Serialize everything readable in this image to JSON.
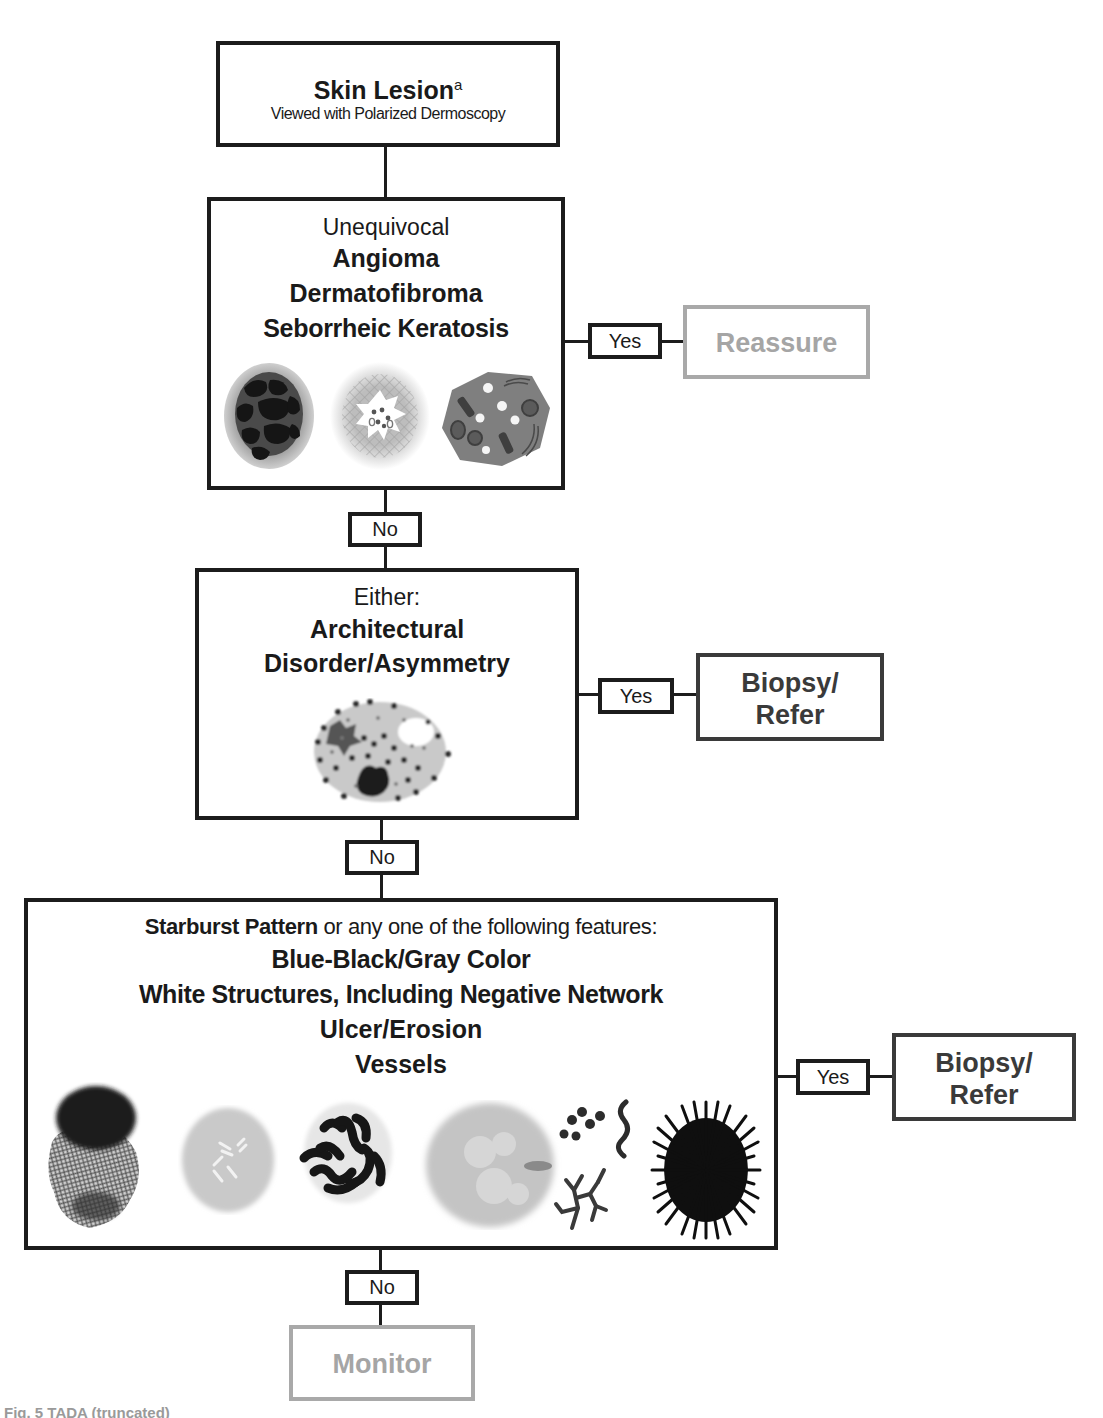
{
  "flowchart": {
    "start": {
      "title": "Skin Lesion",
      "title_superscript": "a",
      "subtitle": "Viewed with Polarized Dermoscopy"
    },
    "step1": {
      "lead": "Unequivocal",
      "items": [
        "Angioma",
        "Dermatofibroma",
        "Seborrheic Keratosis"
      ],
      "images": [
        "angioma-illustration",
        "dermatofibroma-illustration",
        "seborrheic-keratosis-illustration"
      ],
      "yes_label": "Yes",
      "yes_outcome": "Reassure",
      "no_label": "No"
    },
    "step2": {
      "lead": "Either:",
      "items": [
        "Architectural",
        "Disorder/Asymmetry"
      ],
      "images": [
        "disordered-lesion-illustration"
      ],
      "yes_label": "Yes",
      "yes_outcome_line1": "Biopsy/",
      "yes_outcome_line2": "Refer",
      "no_label": "No"
    },
    "step3": {
      "lead_bold": "Starburst Pattern",
      "lead_rest": " or any one of the following features:",
      "items": [
        "Blue-Black/Gray Color",
        "White Structures, Including Negative Network",
        "Ulcer/Erosion",
        "Vessels"
      ],
      "images": [
        "blue-black-gray-illustration",
        "white-structures-illustration",
        "negative-network-illustration",
        "ulcer-erosion-illustration",
        "vessels-illustration",
        "starburst-illustration"
      ],
      "yes_label": "Yes",
      "yes_outcome_line1": "Biopsy/",
      "yes_outcome_line2": "Refer",
      "no_label": "No"
    },
    "end": {
      "outcome": "Monitor"
    }
  },
  "colors": {
    "line": "#1c1c1c",
    "gray_outcome": "#a5a5a5",
    "dark_outcome": "#3a3a3a"
  },
  "caption": {
    "text": "Fig. 5  TADA (truncated)"
  }
}
